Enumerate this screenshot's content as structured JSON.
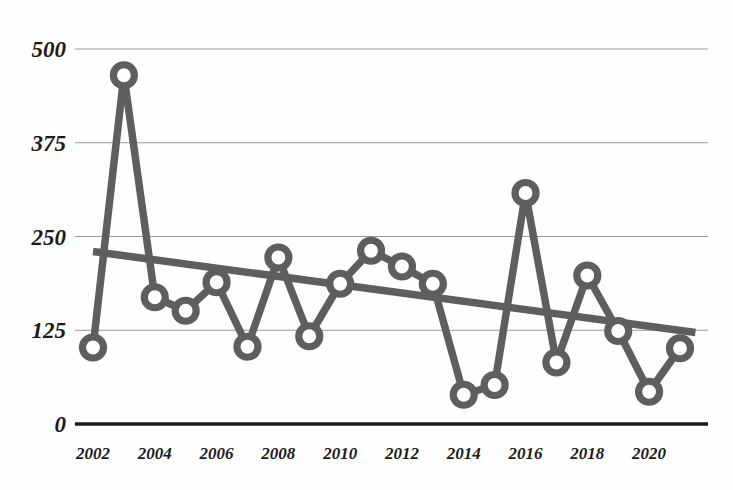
{
  "chart_data": {
    "type": "line",
    "title": "",
    "subtitle": "",
    "xlabel": "",
    "ylabel": "",
    "grid": true,
    "legend": null,
    "xlim": [
      2002,
      2021
    ],
    "ylim": [
      0,
      500
    ],
    "y_ticks": [
      0,
      125,
      250,
      375,
      500
    ],
    "y_tick_labels": [
      "0",
      "125",
      "250",
      "375",
      "500"
    ],
    "x_ticks": [
      2002,
      2004,
      2006,
      2008,
      2010,
      2012,
      2014,
      2016,
      2018,
      2020
    ],
    "x_tick_labels": [
      "2002",
      "2004",
      "2006",
      "2008",
      "2010",
      "2012",
      "2014",
      "2016",
      "2018",
      "2020"
    ],
    "x": [
      2002,
      2003,
      2004,
      2005,
      2006,
      2007,
      2008,
      2009,
      2010,
      2011,
      2012,
      2013,
      2014,
      2015,
      2016,
      2017,
      2018,
      2019,
      2020,
      2021
    ],
    "series": [
      {
        "name": "values",
        "marker": "circle-open",
        "color": "#5e5e5e",
        "values": [
          102,
          465,
          169,
          151,
          189,
          103,
          222,
          117,
          187,
          231,
          210,
          187,
          39,
          52,
          308,
          82,
          198,
          124,
          43,
          101
        ]
      }
    ],
    "trendline": {
      "name": "linear-trend",
      "color": "#5e5e5e",
      "x_start": 2002,
      "x_end": 2021.5,
      "y_start": 230,
      "y_end": 122
    }
  },
  "colors": {
    "series": "#5e5e5e",
    "axis": "#1d1d1d",
    "grid": "#9a9a9a",
    "background": "#fefefe",
    "text": "#1b1b1b"
  }
}
